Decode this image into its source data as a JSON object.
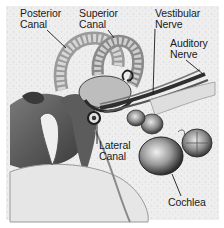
{
  "figure": {
    "labels": {
      "posterior_canal": [
        "Posterior",
        "Canal"
      ],
      "superior_canal": [
        "Superior",
        "Canal"
      ],
      "vestibular_nerve": [
        "Vestibular",
        "Nerve"
      ],
      "auditory_nerve": [
        "Auditory",
        "Nerve"
      ],
      "lateral_canal": [
        "Lateral",
        "Canal"
      ],
      "cochlea": [
        "Cochlea"
      ]
    },
    "colors": {
      "background": "#f2f2f2",
      "ink": "#1a1a1a",
      "mid_gray": "#8a8a8a",
      "light_gray": "#d4d4d4",
      "dark": "#3a3a3a"
    }
  }
}
